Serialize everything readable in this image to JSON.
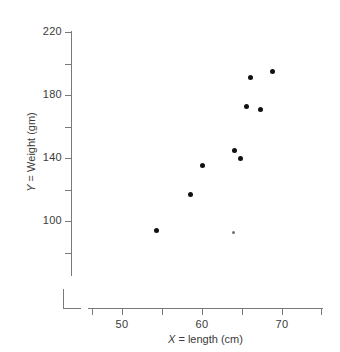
{
  "figure": {
    "background_color": "#ffffff",
    "axis_color": "#7a7a7a",
    "point_color": "#111111",
    "faint_point_color": "#6f6f6f",
    "x_axis_title_prefix": "X",
    "x_axis_title_rest": " = length (cm)",
    "y_axis_title_prefix": "Y",
    "y_axis_title_rest": " = Weight (gm)"
  },
  "chart_data": {
    "type": "scatter",
    "title": "",
    "xlabel": "X = length (cm)",
    "ylabel": "Y = Weight (gm)",
    "xlim": [
      46,
      75
    ],
    "ylim": [
      64,
      220
    ],
    "grid": false,
    "legend": null,
    "x_ticks_major": [
      50,
      60,
      70
    ],
    "x_tick_labels": [
      "50",
      "60",
      "70"
    ],
    "x_ticks_minor": [
      55,
      65
    ],
    "y_ticks_major": [
      220,
      180,
      140,
      100
    ],
    "y_tick_labels": [
      "220",
      "180",
      "140",
      "100"
    ],
    "y_ticks_minor": [
      200,
      160,
      120,
      80
    ],
    "points": [
      {
        "x": 54.3,
        "y": 94
      },
      {
        "x": 58.5,
        "y": 117
      },
      {
        "x": 60.0,
        "y": 135
      },
      {
        "x": 63.9,
        "y": 93,
        "faint": true
      },
      {
        "x": 64.0,
        "y": 145
      },
      {
        "x": 64.8,
        "y": 140
      },
      {
        "x": 65.5,
        "y": 173
      },
      {
        "x": 66.1,
        "y": 191
      },
      {
        "x": 67.3,
        "y": 171
      },
      {
        "x": 68.8,
        "y": 195
      }
    ]
  }
}
